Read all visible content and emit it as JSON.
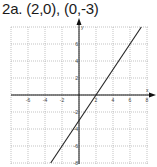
{
  "title": "2a. (2,0), (0,-3)",
  "chart_data": {
    "type": "line",
    "title": "2a. (2,0), (0,-3)",
    "xlabel": "x",
    "ylabel": "y",
    "xlim": [
      -7,
      8.5
    ],
    "ylim": [
      -8,
      8
    ],
    "grid": true,
    "x_ticks": [
      -6,
      -4,
      -2,
      2,
      4,
      6,
      8
    ],
    "y_ticks": [
      6,
      4,
      2,
      -2,
      -4,
      -6,
      -8
    ],
    "points_labeled": [
      [
        2,
        0
      ],
      [
        0,
        -3
      ]
    ],
    "series": [
      {
        "name": "y = 1.5x - 3",
        "equation": "y = 1.5x - 3",
        "x": [
          -3.33,
          7.33
        ],
        "y": [
          -8,
          8
        ]
      }
    ],
    "colors": {
      "line": "#222222",
      "grid": "#9a9a9a",
      "axes": "#111111"
    }
  }
}
